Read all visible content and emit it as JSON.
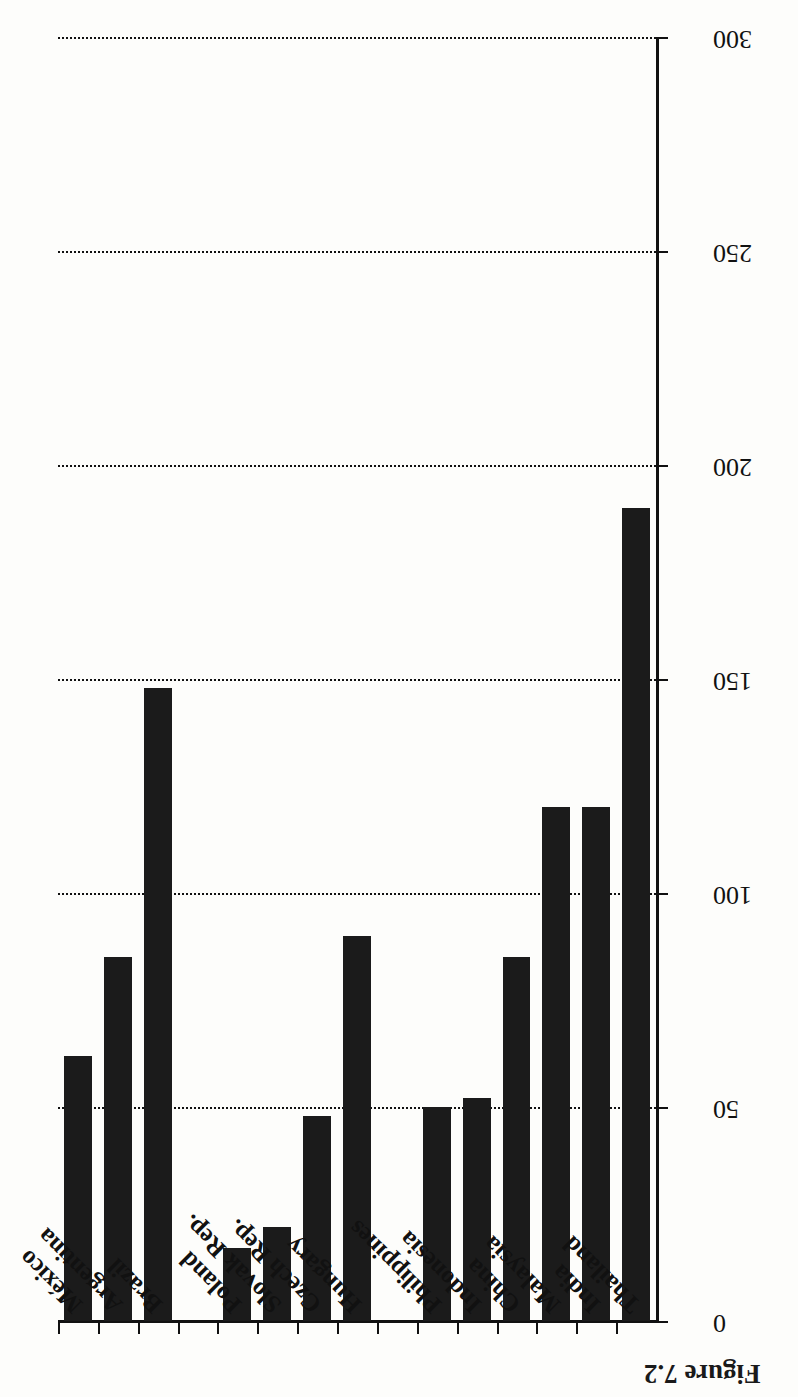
{
  "figure": {
    "caption": "Figure 7.2"
  },
  "chart_data": {
    "type": "bar",
    "orientation": "horizontal",
    "title": "",
    "subtitle": "",
    "xlabel": "",
    "ylabel": "",
    "xlim": [
      0,
      300
    ],
    "xticks": [
      0,
      50,
      100,
      150,
      200,
      250,
      300
    ],
    "xtick_labels": [
      "0",
      "50",
      "100",
      "150",
      "200",
      "250",
      "300"
    ],
    "grid": true,
    "grid_style": "dotted-vertical",
    "legend": null,
    "bar_color": "#1b1b1b",
    "categories": [
      "Thailand",
      "India",
      "Malaysia",
      "China",
      "Indonesia",
      "Philippines",
      "",
      "Hungary",
      "Czech Rep.",
      "Slovak Rep.",
      "Poland",
      "",
      "Brazil",
      "Argentina",
      "México"
    ],
    "values": [
      190,
      120,
      120,
      85,
      52,
      50,
      0,
      90,
      48,
      22,
      17,
      0,
      148,
      85,
      62
    ]
  }
}
